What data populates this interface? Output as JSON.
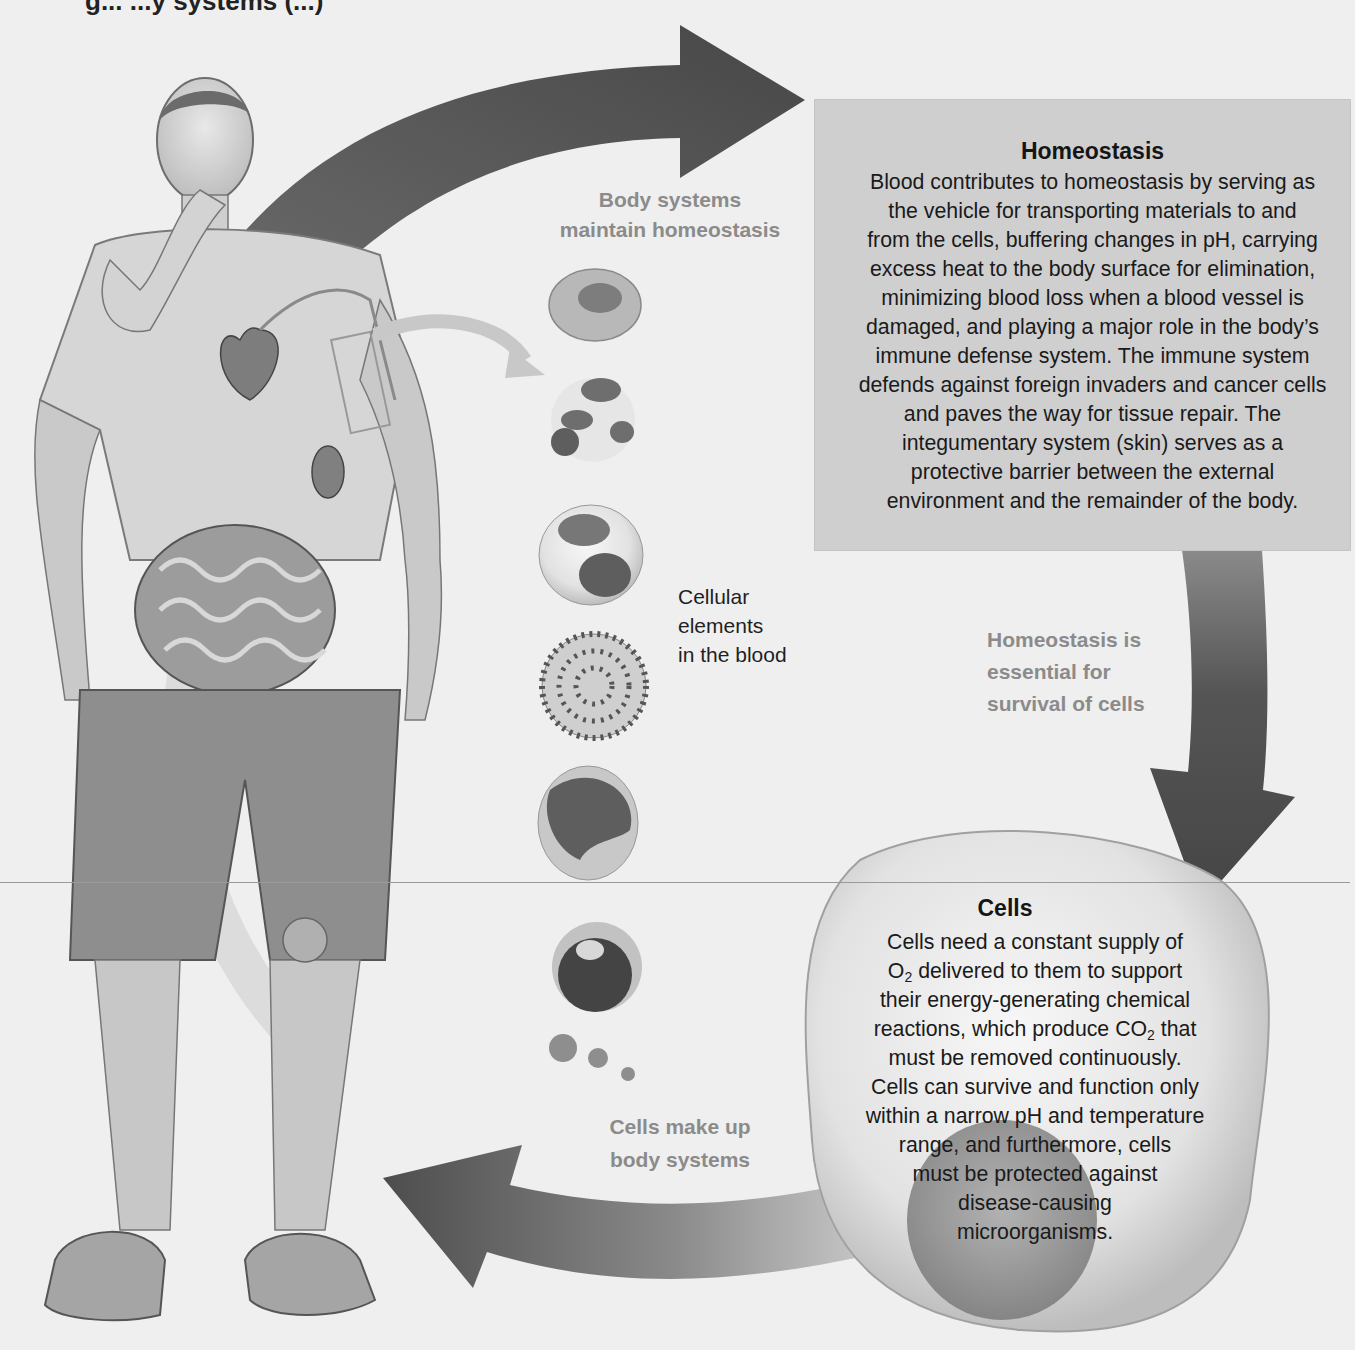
{
  "figure": {
    "title_fragment": "g... ...y systems (...)",
    "background_color": "#efefef",
    "arrow_color": "#4a4a4a",
    "box_color": "#cfcfcf"
  },
  "homeostasis_box": {
    "title": "Homeostasis",
    "lines": [
      "Blood contributes to homeostasis by serving as",
      "the vehicle for transporting materials to and",
      "from the cells, buffering changes in pH, carrying",
      "excess heat to the body surface for elimination,",
      "minimizing blood loss when a blood vessel is",
      "damaged, and playing a major role in the body’s",
      "immune defense system. The immune system",
      "defends against foreign invaders and cancer cells",
      "and paves the way for tissue repair. The",
      "integumentary system (skin) serves as a",
      "protective barrier between the external",
      "environment and the remainder of the body."
    ]
  },
  "cycle_labels": {
    "body_systems_line1": "Body systems",
    "body_systems_line2": "maintain homeostasis",
    "homeostasis_essential_line1": "Homeostasis is",
    "homeostasis_essential_line2": "essential for",
    "homeostasis_essential_line3": "survival of cells",
    "cells_make_up_line1": "Cells make up",
    "cells_make_up_line2": "body systems"
  },
  "blood_cells": {
    "label_line1": "Cellular",
    "label_line2": "elements",
    "label_line3": "in the blood",
    "items": [
      {
        "name": "erythrocyte"
      },
      {
        "name": "neutrophil"
      },
      {
        "name": "eosinophil"
      },
      {
        "name": "basophil"
      },
      {
        "name": "monocyte"
      },
      {
        "name": "lymphocyte"
      },
      {
        "name": "platelets"
      }
    ]
  },
  "cells_box": {
    "title": "Cells",
    "line1": "Cells need a constant supply of",
    "line2_pre": "O",
    "line2_sub": "2",
    "line2_post": " delivered to them to support",
    "line3": "their energy-generating chemical",
    "line4_pre": "reactions, which produce CO",
    "line4_sub": "2",
    "line4_post": " that",
    "line5": "must be removed continuously.",
    "line6": "Cells can survive and function only",
    "line7": "within a narrow pH and temperature",
    "line8": "range, and furthermore, cells",
    "line9": "must be protected against",
    "line10": "disease-causing",
    "line11": "microorganisms."
  }
}
